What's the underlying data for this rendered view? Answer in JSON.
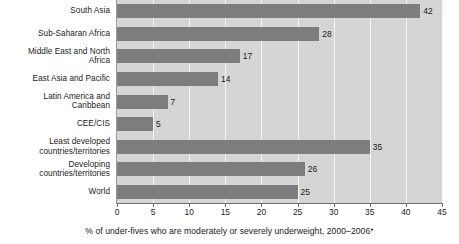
{
  "chart_data": {
    "type": "bar",
    "orientation": "horizontal",
    "title": "",
    "subtitle": "",
    "xlabel": "% of under-fives who are moderately or severely underweight, 2000–2006*",
    "ylabel": "",
    "categories": [
      "South Asia",
      "Sub-Saharan Africa",
      "Middle East and North Africa",
      "East Asia and Pacific",
      "Latin America and Caribbean",
      "CEE/CIS",
      "Least developed countries/territories",
      "Developing countries/territories",
      "World"
    ],
    "category_lines": [
      [
        "South Asia"
      ],
      [
        "Sub-Saharan Africa"
      ],
      [
        "Middle East and North",
        "Africa"
      ],
      [
        "East Asia and Pacific"
      ],
      [
        "Latin America and",
        "Caribbean"
      ],
      [
        "CEE/CIS"
      ],
      [
        "Least developed",
        "countries/territories"
      ],
      [
        "Developing",
        "countries/territories"
      ],
      [
        "World"
      ]
    ],
    "values": [
      42,
      28,
      17,
      14,
      7,
      5,
      35,
      26,
      25
    ],
    "value_labels": [
      "42",
      "28",
      "17",
      "14",
      "7",
      "5",
      "35",
      "26",
      "25"
    ],
    "xlim": [
      0,
      45
    ],
    "xticks": [
      0,
      5,
      10,
      15,
      20,
      25,
      30,
      35,
      40,
      45
    ],
    "xtick_labels": [
      "0",
      "5",
      "10",
      "15",
      "20",
      "25",
      "30",
      "35",
      "40",
      "45"
    ],
    "grid": true,
    "grid_axis": "x",
    "legend": null,
    "colors": {
      "bar": "#7d7d7d",
      "plot_background": "#d5d5d5",
      "gridline": "#f4f4f4",
      "axis": "#6e6e6e",
      "text": "#1a1a1a",
      "page_background": "#ffffff"
    }
  },
  "caption": {
    "text": "% of under-fives who are moderately or severely underweight, 2000–2006*"
  }
}
